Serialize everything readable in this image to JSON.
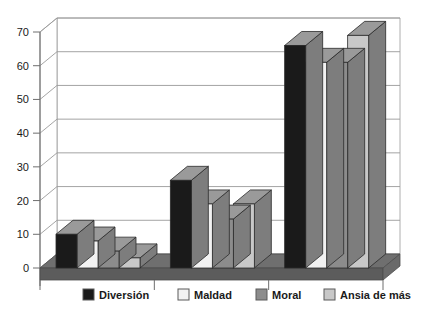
{
  "chart_data": {
    "type": "bar",
    "title": "",
    "subtitle": "",
    "xlabel": "",
    "ylabel": "",
    "ylim": [
      0,
      70
    ],
    "ytick_step": 10,
    "yticks": [
      0,
      10,
      20,
      30,
      40,
      50,
      60,
      70
    ],
    "ytick_labels": [
      "0",
      "10",
      "20",
      "30",
      "40",
      "50",
      "60",
      "70"
    ],
    "grid": true,
    "grid_axis": "y",
    "legend_position": "bottom",
    "three_d": true,
    "categories": [
      "",
      "",
      ""
    ],
    "series": [
      {
        "name": "Diversión",
        "color": "#1a1a1a",
        "values": [
          10,
          26,
          66
        ]
      },
      {
        "name": "Maldad",
        "color": "#f2f2f2",
        "values": [
          8,
          19,
          61
        ]
      },
      {
        "name": "Moral",
        "color": "#8c8c8c",
        "values": [
          5,
          14.5,
          61
        ]
      },
      {
        "name": "Ansia de más",
        "color": "#c8c8c8",
        "values": [
          3,
          19,
          69
        ]
      }
    ],
    "annotations": []
  },
  "legend": {
    "items": [
      {
        "label": "Diversión",
        "swatch": "#1a1a1a"
      },
      {
        "label": "Maldad",
        "swatch": "#f2f2f2"
      },
      {
        "label": "Moral",
        "swatch": "#8c8c8c"
      },
      {
        "label": "Ansia de más",
        "swatch": "#c8c8c8"
      }
    ]
  },
  "style": {
    "background": "#ffffff",
    "gridline_color": "#9a9a9a",
    "axis_color": "#6e6e6e",
    "floor_color": "#6f6f6f",
    "floor_edge_color": "#4d4d4d",
    "bar_top_color": "#9a9a9a",
    "bar_side_color": "#7d7d7d",
    "bar_outline": "#2b2b2b"
  }
}
